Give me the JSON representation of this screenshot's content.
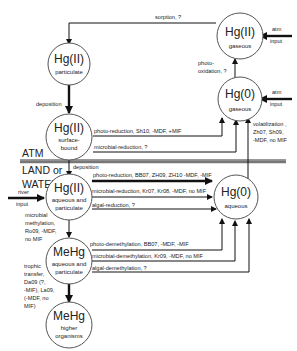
{
  "nodes": {
    "hg2_gaseous": {
      "title": "Hg(II)",
      "sub": [
        "gaseous"
      ]
    },
    "hg0_gaseous": {
      "title": "Hg(0)",
      "sub": [
        "gaseous"
      ]
    },
    "hg2_particulate": {
      "title": "Hg(II)",
      "sub": [
        "particulate"
      ]
    },
    "hg2_surface": {
      "title": "Hg(II)",
      "sub": [
        "surface-",
        "bound"
      ]
    },
    "hg2_aqueous": {
      "title": "Hg(II)",
      "sub": [
        "aqueous and",
        "particulate"
      ]
    },
    "hg0_aqueous": {
      "title": "Hg(0)",
      "sub": [
        "aqueous"
      ]
    },
    "mehg_aqueous": {
      "title": "MeHg",
      "sub": [
        "aqueous and",
        "particulate"
      ]
    },
    "mehg_higher": {
      "title": "MeHg",
      "sub": [
        "higher",
        "organisms"
      ]
    }
  },
  "zones": {
    "atm": "ATM",
    "land1": "LAND or",
    "land2": "WATER"
  },
  "labels": {
    "sorption": "sorption, ?",
    "atm_input_1a": "atm",
    "atm_input_1b": "input",
    "atm_input_2a": "atm",
    "atm_input_2b": "input",
    "photo_oxidation_1": "photo-",
    "photo_oxidation_2": "oxidation, ?",
    "deposition_1": "deposition",
    "photo_reduction_surface": "photo-reduction, Sh10, -MDF, +MIF",
    "microbial_reduction_surface": "microbial-reduction, ?",
    "volatilization_1": "volatilization ,",
    "volatilization_2": "Zh07, Sh09,",
    "volatilization_3": "-MDF, no MIF",
    "deposition_2": "deposition",
    "photo_reduction_aq": "photo-reduction, BB07, ZH09, ZH10 -MDF, -MIF",
    "microbial_reduction_aq": "microbial-reduction, Kr07, Kr08, -MDF, no MIF",
    "algal_reduction": "algal-reduction, ?",
    "river_input_1": "river",
    "river_input_2": "input",
    "methylation": [
      "microbial",
      "methylation,",
      "Ro09, -MDF,",
      "no MIF"
    ],
    "photo_demethylation": "photo-demethylation, BB07, -MDF, -MIF",
    "microbial_demethylation": "microbial-demethylation, Kr09, -MDF, no MIF",
    "algal_demethylation": "algal-demethylation, ?",
    "trophic": [
      "trophic",
      "transfer,",
      "Da09 (?,",
      "-MIF), La09,",
      "(-MDF, no",
      "MIF)"
    ]
  }
}
